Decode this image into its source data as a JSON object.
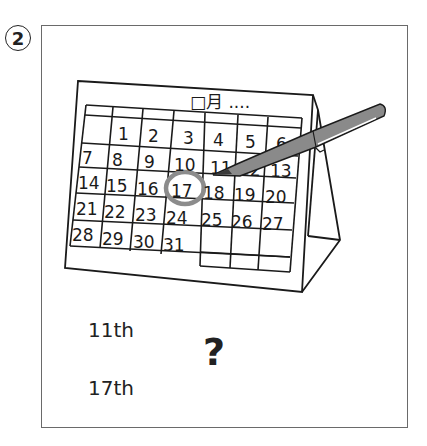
{
  "question": {
    "number": "2",
    "calendar": {
      "header": "□月 ....",
      "weeks": [
        [
          "",
          "1",
          "2",
          "3",
          "4",
          "5",
          "6"
        ],
        [
          "7",
          "8",
          "9",
          "10",
          "11",
          "12",
          "13"
        ],
        [
          "14",
          "15",
          "16",
          "17",
          "18",
          "19",
          "20"
        ],
        [
          "21",
          "22",
          "23",
          "24",
          "25",
          "26",
          "27"
        ],
        [
          "28",
          "29",
          "30",
          "31",
          "",
          "",
          ""
        ]
      ],
      "circled_date": "17",
      "pen_pointing_at": "11"
    },
    "options": [
      {
        "label": "11th"
      },
      {
        "label": "17th"
      }
    ],
    "prompt_symbol": "?"
  },
  "colors": {
    "ink": "#1a1a1a",
    "pen_gray": "#8a8a8a",
    "circle_gray": "#8c8c8c",
    "frame": "#6a6a6a"
  }
}
